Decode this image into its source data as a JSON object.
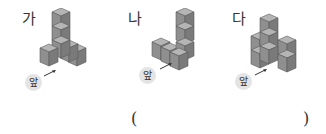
{
  "figures": [
    {
      "label": "가",
      "front_label": "앞"
    },
    {
      "label": "나",
      "front_label": "앞"
    },
    {
      "label": "다",
      "front_label": "앞"
    }
  ],
  "answer": {
    "open_paren": "(",
    "close_paren": ")",
    "value": ""
  },
  "colors": {
    "cube_top": "#b5b5b5",
    "cube_left": "#8f8f8f",
    "cube_right": "#7a7a7a",
    "edge": "#5a5a5a",
    "badge_bg": "#e4e4e4"
  }
}
